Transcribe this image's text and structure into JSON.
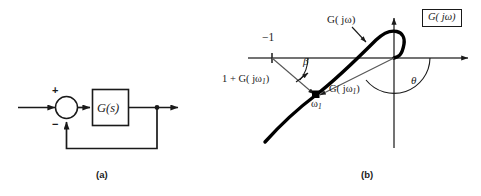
{
  "figure": {
    "panels": [
      {
        "id": "a",
        "caption": "(a)",
        "title": "closed-loop block diagram",
        "block_label": "G(s)",
        "summing_plus": "+",
        "summing_minus": "−"
      },
      {
        "id": "b",
        "caption": "(b)",
        "title": "polar (Nyquist) plot",
        "plane_label_G": "G",
        "plane_label_arg": "( jω)",
        "curve_label_G": "G",
        "curve_label_arg": "( jω)",
        "critical_point_label": "−1",
        "vector_sum_label_prefix": "1 + ",
        "vector_sum_label_G": "G",
        "vector_sum_label_arg_open": "( jω",
        "vector_sum_label_sub": "1",
        "vector_sum_label_arg_close": ")",
        "vector_label_G": "G",
        "vector_label_arg_open": "( jω",
        "vector_label_sub": "1",
        "vector_label_arg_close": ")",
        "frequency_point_label": "ω",
        "frequency_point_sub": "1",
        "angle_beta": "β",
        "angle_theta": "θ"
      }
    ],
    "colors": {
      "ink": "#1a1a1a",
      "curve": "#000000",
      "background": "#ffffff"
    }
  }
}
